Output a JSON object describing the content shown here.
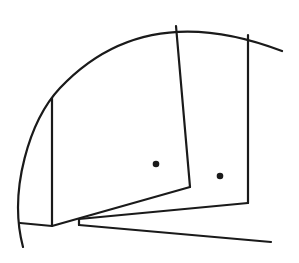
{
  "diagram": {
    "stroke_color": "#1a1a1a",
    "background_color": "#ffffff",
    "stroke_width": 2.2,
    "arc": {
      "path": "M 23 247 C 8 190, 30 120, 60 88 C 110 35, 180 12, 282 51"
    },
    "lines": [
      {
        "name": "left-vertical-line",
        "x1": 52,
        "y1": 98,
        "x2": 52,
        "y2": 226
      },
      {
        "name": "bottom-left-base-line",
        "x1": 20,
        "y1": 223,
        "x2": 52,
        "y2": 226
      },
      {
        "name": "panel-1-bottom-edge",
        "x1": 52,
        "y1": 226,
        "x2": 190,
        "y2": 187
      },
      {
        "name": "panel-1-right-edge",
        "x1": 190,
        "y1": 187,
        "x2": 176,
        "y2": 26
      },
      {
        "name": "panel-2-notch",
        "x1": 79,
        "y1": 219,
        "x2": 79,
        "y2": 225
      },
      {
        "name": "panel-2-bottom-edge",
        "x1": 79,
        "y1": 219,
        "x2": 248,
        "y2": 203
      },
      {
        "name": "panel-2-right-edge",
        "x1": 248,
        "y1": 203,
        "x2": 248,
        "y2": 35
      },
      {
        "name": "bottom-long-line",
        "x1": 79,
        "y1": 225,
        "x2": 271,
        "y2": 242
      }
    ],
    "dots": [
      {
        "name": "panel-1-dot",
        "cx": 156,
        "cy": 164,
        "r": 3.3
      },
      {
        "name": "panel-2-dot",
        "cx": 220,
        "cy": 176,
        "r": 3.3
      }
    ]
  }
}
